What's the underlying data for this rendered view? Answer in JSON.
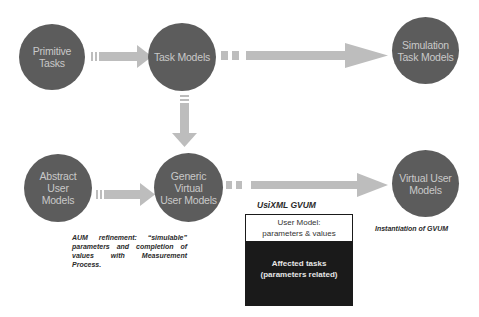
{
  "diagram": {
    "nodes": [
      {
        "id": "primitive_tasks",
        "label_line1": "Primitive",
        "label_line2": "Tasks"
      },
      {
        "id": "task_models",
        "label_line1": "Task Models",
        "label_line2": ""
      },
      {
        "id": "simulation_task_models",
        "label_line1": "Simulation",
        "label_line2": "Task Models"
      },
      {
        "id": "abstract_user_models",
        "label_line1": "Abstract User",
        "label_line2": "Models"
      },
      {
        "id": "generic_virtual_user_models",
        "label_line1": "Generic Virtual",
        "label_line2": "User Models"
      },
      {
        "id": "virtual_user_models",
        "label_line1": "Virtual User",
        "label_line2": "Models"
      }
    ],
    "edges": [
      {
        "from": "primitive_tasks",
        "to": "task_models"
      },
      {
        "from": "task_models",
        "to": "simulation_task_models"
      },
      {
        "from": "task_models",
        "to": "generic_virtual_user_models"
      },
      {
        "from": "abstract_user_models",
        "to": "generic_virtual_user_models"
      },
      {
        "from": "generic_virtual_user_models",
        "to": "virtual_user_models"
      }
    ],
    "aum_note": "AUM refinement: “simulable” parameters and completion of values with Measurement Process.",
    "gvum_title": "UsiXML GVUM",
    "gvum_box": {
      "top_line1": "User Model:",
      "top_line2": "parameters & values",
      "bottom_line1": "Affected tasks",
      "bottom_line2": "(parameters related)"
    },
    "instantiation_note": "Instantiation of GVUM",
    "colors": {
      "node_fill": "#5c5c5c",
      "node_text": "#c9c9c9",
      "arrow": "#bdbdbd",
      "box_dark": "#1a1a1a"
    }
  }
}
